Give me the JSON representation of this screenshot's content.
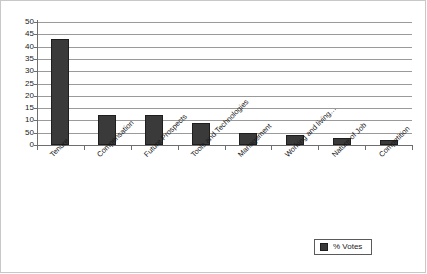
{
  "chart_data": {
    "type": "bar",
    "title": "",
    "xlabel": "",
    "ylabel": "",
    "ylim": [
      0,
      50
    ],
    "grid": true,
    "legend_position": "bottom-right",
    "categories": [
      "Tenure",
      "Compensation",
      "Future Prospects",
      "Tools and Technologies",
      "Management",
      "Working and living…",
      "Nature of Job",
      "Competition"
    ],
    "series": [
      {
        "name": "% Votes",
        "color": "#3a3a3a",
        "values": [
          43,
          12,
          12,
          9,
          5,
          4,
          3,
          2
        ]
      }
    ],
    "y_ticks": [
      "50",
      "45",
      "40",
      "35",
      "30",
      "25",
      "20",
      "15",
      "10",
      "50",
      "0"
    ],
    "y_tick_values": [
      50,
      45,
      40,
      35,
      30,
      25,
      20,
      15,
      10,
      5,
      0
    ]
  },
  "legend": {
    "label": "% Votes",
    "swatch_color": "#3a3a3a"
  },
  "colors": {
    "bar": "#3a3a3a",
    "bar_border": "#1e1e1e",
    "gridline": "#9a9a9a",
    "axis": "#6e6e6e",
    "text": "#1a1a1a",
    "frame": "#c8c8c8",
    "background": "#ffffff"
  }
}
